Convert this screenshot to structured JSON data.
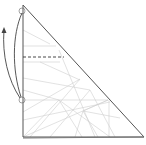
{
  "diagram": {
    "type": "origami-fold-step",
    "title": "",
    "colors": {
      "outline": "#555555",
      "crease": "#c8c8c8",
      "arrow": "#444444",
      "dashed": "#333333",
      "background": "#ffffff"
    },
    "paper": {
      "shape": "right-triangle",
      "vertices": [
        [
          23,
          5
        ],
        [
          23,
          137
        ],
        [
          144,
          137
        ]
      ]
    },
    "markers": [
      {
        "name": "top-point-circle",
        "cx": 22,
        "cy": 11,
        "r": 3
      },
      {
        "name": "lower-point-circle",
        "cx": 22,
        "cy": 100,
        "r": 3
      }
    ],
    "fold_line": {
      "style": "dashed",
      "x1": 23,
      "y1": 57,
      "x2": 64,
      "y2": 57
    },
    "arrows": [
      {
        "name": "fold-up-arrow",
        "desc": "curved arrow from lower point to top point"
      },
      {
        "name": "unfold-arrow",
        "desc": "curved arrow from lower point up and out to the left"
      }
    ]
  }
}
